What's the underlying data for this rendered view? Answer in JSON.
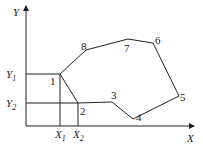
{
  "diagram": {
    "axes": {
      "x_label": "X",
      "y_label": "Y"
    },
    "reference_lines": {
      "y1_label": "Y",
      "y1_sub": "1",
      "y2_label": "Y",
      "y2_sub": "2",
      "x1_label": "X",
      "x1_sub": "1",
      "x2_label": "X",
      "x2_sub": "2"
    },
    "vertices": [
      {
        "id": "1",
        "label": "1"
      },
      {
        "id": "2",
        "label": "2"
      },
      {
        "id": "3",
        "label": "3"
      },
      {
        "id": "4",
        "label": "4"
      },
      {
        "id": "5",
        "label": "5"
      },
      {
        "id": "6",
        "label": "6"
      },
      {
        "id": "7",
        "label": "7"
      },
      {
        "id": "8",
        "label": "8"
      }
    ]
  }
}
